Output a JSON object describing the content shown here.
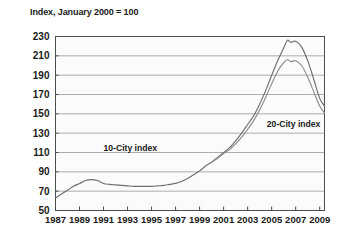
{
  "chart_data": {
    "type": "line",
    "title": "Index, January 2000 = 100",
    "xlabel": "",
    "ylabel": "",
    "xlim": [
      1987,
      2009.4
    ],
    "ylim": [
      50,
      230
    ],
    "ygrid": true,
    "yticks": [
      230,
      210,
      190,
      170,
      150,
      130,
      110,
      90,
      70,
      50
    ],
    "ytick_labels": [
      "230",
      "210",
      "190",
      "170",
      "150",
      "130",
      "110",
      "90",
      "70",
      "50"
    ],
    "xticks": [
      1987,
      1989,
      1991,
      1993,
      1995,
      1997,
      1999,
      2001,
      2003,
      2005,
      2007,
      2009
    ],
    "xtick_labels": [
      "1987",
      "1989",
      "1991",
      "1993",
      "1995",
      "1997",
      "1999",
      "2001",
      "2003",
      "2005",
      "2007",
      "2009"
    ],
    "legend_position": "inline-annotations",
    "annotations": [
      {
        "text": "10-City index",
        "x": 1991.0,
        "y": 112
      },
      {
        "text": "20-City index",
        "x": 2004.6,
        "y": 136
      }
    ],
    "series": [
      {
        "name": "10-City index",
        "color": "#6e6e6e",
        "x": [
          1987.0,
          1987.5,
          1988.0,
          1988.5,
          1989.0,
          1989.5,
          1990.0,
          1990.5,
          1991.0,
          1991.5,
          1992.0,
          1992.5,
          1993.0,
          1993.5,
          1994.0,
          1994.5,
          1995.0,
          1995.5,
          1996.0,
          1996.5,
          1997.0,
          1997.5,
          1998.0,
          1998.5,
          1999.0,
          1999.5,
          2000.0,
          2000.5,
          2001.0,
          2001.5,
          2002.0,
          2002.5,
          2003.0,
          2003.5,
          2004.0,
          2004.5,
          2005.0,
          2005.5,
          2006.0,
          2006.3,
          2006.6,
          2007.0,
          2007.5,
          2008.0,
          2008.5,
          2009.0,
          2009.4
        ],
        "values": [
          63,
          67,
          71,
          75,
          78,
          81,
          82,
          81,
          78,
          77,
          76.5,
          76,
          75.5,
          75,
          75,
          75,
          75,
          75.5,
          76,
          77,
          78,
          80,
          83,
          87,
          91,
          96,
          100,
          105,
          110,
          115,
          122,
          130,
          139,
          148,
          160,
          174,
          190,
          205,
          218,
          226,
          224,
          225,
          219,
          205,
          186,
          166,
          158
        ]
      },
      {
        "name": "20-City index",
        "color": "#8c8c8c",
        "x": [
          2000.0,
          2000.5,
          2001.0,
          2001.5,
          2002.0,
          2002.5,
          2003.0,
          2003.5,
          2004.0,
          2004.5,
          2005.0,
          2005.5,
          2006.0,
          2006.3,
          2006.6,
          2007.0,
          2007.5,
          2008.0,
          2008.5,
          2009.0,
          2009.4
        ],
        "values": [
          100,
          104,
          109,
          113,
          119,
          126,
          134,
          143,
          154,
          167,
          181,
          194,
          203,
          206,
          204,
          205,
          200,
          188,
          173,
          158,
          151
        ]
      }
    ]
  }
}
